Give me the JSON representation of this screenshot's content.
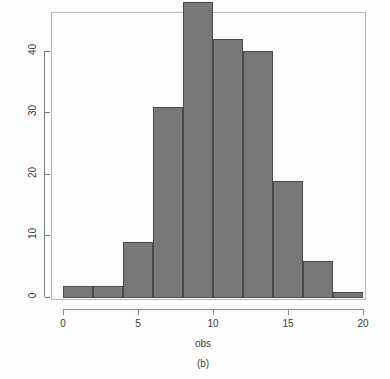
{
  "chart_data": {
    "type": "bar",
    "subtype": "histogram",
    "title": "",
    "subtitle": "",
    "xlabel": "obs",
    "ylabel": "frequency",
    "caption": "(b)",
    "bin_width": 2,
    "bin_edges": [
      0,
      2,
      4,
      6,
      8,
      10,
      12,
      14,
      16,
      18,
      20
    ],
    "categories": [
      "0-2",
      "2-4",
      "4-6",
      "6-8",
      "8-10",
      "10-12",
      "12-14",
      "14-16",
      "16-18",
      "18-20"
    ],
    "values": [
      2,
      2,
      9,
      31,
      48,
      42,
      40,
      19,
      6,
      1
    ],
    "x": [
      1,
      3,
      5,
      7,
      9,
      11,
      13,
      15,
      17,
      19
    ],
    "xlim": [
      0,
      20
    ],
    "ylim": [
      0,
      49
    ],
    "xticks": [
      0,
      5,
      10,
      15,
      20
    ],
    "xtick_labels": [
      "0",
      "5",
      "10",
      "15",
      "20"
    ],
    "yticks": [
      0,
      10,
      20,
      30,
      40
    ],
    "ytick_labels": [
      "0",
      "10",
      "20",
      "30",
      "40"
    ],
    "grid": false,
    "legend": null,
    "bar_fill_color": "#787878",
    "bar_border_color": "#4a4a4a",
    "axis_color": "#7a7a7a",
    "frame_color": "#b9b9b9",
    "background_color": "#fdfdfd",
    "total_count": 200
  }
}
